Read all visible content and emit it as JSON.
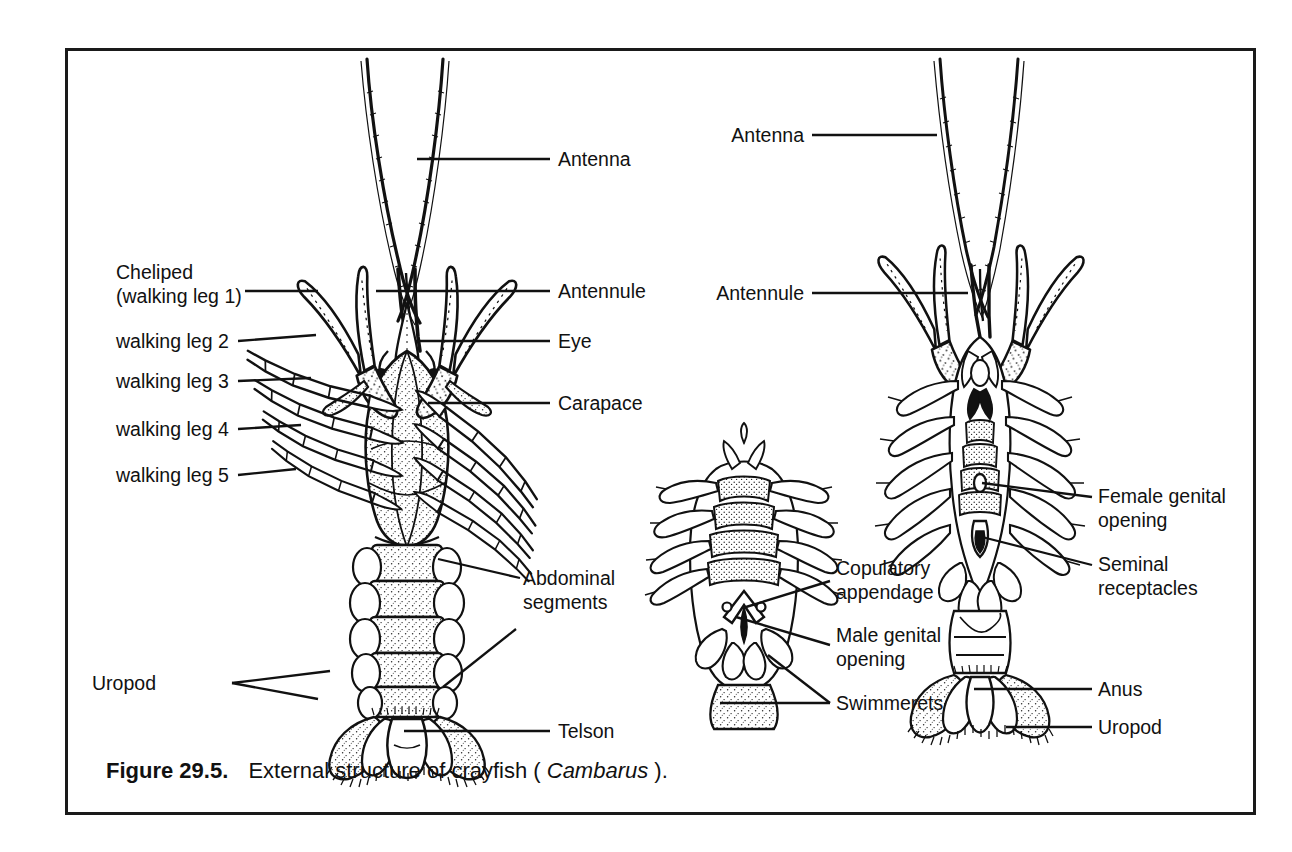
{
  "figure": {
    "number_label": "Figure 29.5.",
    "caption_main": "External structure of crayfish (",
    "caption_species": "Cambarus",
    "caption_tail": ")."
  },
  "specimens": {
    "left": {
      "view": "dorsal view of crayfish",
      "labels_left": [
        {
          "id": "cheliped",
          "line1": "Cheliped",
          "line2": "(walking leg 1)"
        },
        {
          "id": "walking-leg-2",
          "line1": "walking leg 2"
        },
        {
          "id": "walking-leg-3",
          "line1": "walking leg 3"
        },
        {
          "id": "walking-leg-4",
          "line1": "walking leg 4"
        },
        {
          "id": "walking-leg-5",
          "line1": "walking leg 5"
        },
        {
          "id": "uropod",
          "line1": "Uropod"
        }
      ],
      "labels_right": [
        {
          "id": "antenna",
          "line1": "Antenna"
        },
        {
          "id": "antennule",
          "line1": "Antennule"
        },
        {
          "id": "eye",
          "line1": "Eye"
        },
        {
          "id": "carapace",
          "line1": "Carapace"
        },
        {
          "id": "abdominal-segments",
          "line1": "Abdominal",
          "line2": "segments"
        },
        {
          "id": "telson",
          "line1": "Telson"
        }
      ]
    },
    "center": {
      "view": "male ventral view",
      "labels_right": [
        {
          "id": "copulatory-appendage",
          "line1": "Copulatory",
          "line2": "appendage"
        },
        {
          "id": "male-genital-opening",
          "line1": "Male genital",
          "line2": "opening"
        },
        {
          "id": "swimmerets",
          "line1": "Swimmerets"
        }
      ]
    },
    "right": {
      "view": "female ventral view",
      "labels_left": [
        {
          "id": "antenna",
          "line1": "Antenna"
        },
        {
          "id": "antennule",
          "line1": "Antennule"
        }
      ],
      "labels_right": [
        {
          "id": "female-genital-opening",
          "line1": "Female genital",
          "line2": "opening"
        },
        {
          "id": "seminal-receptacles",
          "line1": "Seminal",
          "line2": "receptacles"
        },
        {
          "id": "anus",
          "line1": "Anus"
        },
        {
          "id": "uropod",
          "line1": "Uropod"
        }
      ]
    }
  },
  "style": {
    "ink": "#111111",
    "paper": "#ffffff",
    "frame": "#1a1a1a"
  }
}
